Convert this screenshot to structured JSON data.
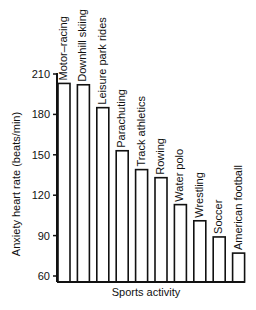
{
  "chart_data": {
    "type": "bar",
    "title": "",
    "xlabel": "Sports activity",
    "ylabel": "Anxiety heart rate (beats/min)",
    "ylim": [
      60,
      210
    ],
    "yticks": [
      60,
      90,
      120,
      150,
      180,
      210
    ],
    "grid": false,
    "legend": null,
    "categories": [
      "Motor–racing",
      "Downhill skiing",
      "Leisure park rides",
      "Parachuting",
      "Track athletics",
      "Rowing",
      "Water polo",
      "Wrestling",
      "Soccer",
      "American football"
    ],
    "values": [
      203,
      202,
      185,
      153,
      139,
      133,
      113,
      101,
      89,
      77
    ],
    "label_orientation": "vertical, above each bar"
  },
  "colors": {
    "bar_fill": "#ffffff",
    "bar_stroke": "#111111",
    "background": "#ffffff"
  }
}
